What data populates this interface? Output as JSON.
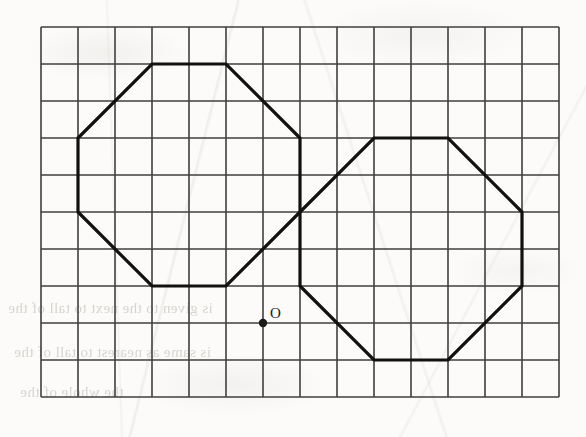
{
  "figure": {
    "background_color": "#fbfaf8",
    "ink_color": "#1a1a1a",
    "grid_line_color": "#3a3a3a"
  },
  "grid": {
    "name": "square-grid",
    "columns": 14,
    "rows": 10,
    "cell_size_px": 37,
    "origin_x_px": 41,
    "origin_y_px": 27,
    "line_width_px": 1.6,
    "color": "#3f3f3f"
  },
  "shapes": [
    {
      "name": "left-octagon",
      "type": "octagon",
      "stroke_width_px": 3.2,
      "color": "#111111",
      "vertices_grid": [
        [
          3,
          1
        ],
        [
          5,
          1
        ],
        [
          7,
          3
        ],
        [
          7,
          5
        ],
        [
          5,
          7
        ],
        [
          3,
          7
        ],
        [
          1,
          5
        ],
        [
          1,
          3
        ]
      ],
      "vertices_px": [
        [
          152,
          64
        ],
        [
          226,
          64
        ],
        [
          300,
          138
        ],
        [
          300,
          212
        ],
        [
          226,
          286
        ],
        [
          152,
          286
        ],
        [
          78,
          212
        ],
        [
          78,
          138
        ]
      ]
    },
    {
      "name": "right-octagon",
      "type": "octagon",
      "stroke_width_px": 3.2,
      "color": "#111111",
      "vertices_grid": [
        [
          9,
          3
        ],
        [
          11,
          3
        ],
        [
          13,
          5
        ],
        [
          13,
          7
        ],
        [
          11,
          9
        ],
        [
          9,
          9
        ],
        [
          7,
          7
        ],
        [
          7,
          5
        ]
      ],
      "vertices_px": [
        [
          374,
          138
        ],
        [
          448,
          138
        ],
        [
          522,
          212
        ],
        [
          522,
          286
        ],
        [
          448,
          360
        ],
        [
          374,
          360
        ],
        [
          300,
          286
        ],
        [
          300,
          212
        ]
      ]
    }
  ],
  "points": [
    {
      "name": "point-O",
      "label": "O",
      "grid": [
        6,
        8
      ],
      "px": [
        263,
        323
      ],
      "dot_radius_px": 4.2,
      "label_offset_px": [
        7,
        -17
      ]
    }
  ],
  "bleed_through_text": [
    {
      "text": "is given to the next to tall of the",
      "x": 8,
      "y": 300,
      "size": 15
    },
    {
      "text": "is same as nearest to tall of the",
      "x": 14,
      "y": 344,
      "size": 15
    },
    {
      "text": "the whole of the",
      "x": 20,
      "y": 384,
      "size": 15
    }
  ]
}
